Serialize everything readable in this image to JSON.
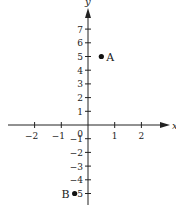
{
  "chart_data": {
    "type": "scatter",
    "title": "",
    "xlabel": "x",
    "ylabel": "y",
    "xlim": [
      -3.1,
      3.0
    ],
    "ylim": [
      -5.8,
      8.5
    ],
    "grid": false,
    "x_ticks": [
      -2,
      -1,
      1,
      2
    ],
    "x_tick_labels": [
      "−2",
      "−1",
      "1",
      "2"
    ],
    "y_ticks": [
      7,
      6,
      5,
      4,
      3,
      2,
      1,
      -1,
      -2,
      -3,
      -4,
      -5
    ],
    "y_tick_labels": [
      "7",
      "6",
      "5",
      "4",
      "3",
      "2",
      "1",
      "−1",
      "−2",
      "−3",
      "−4",
      "5"
    ],
    "origin_label": "0",
    "points": [
      {
        "label": "A",
        "x": 0.5,
        "y": 5
      },
      {
        "label": "B",
        "x": -0.5,
        "y": -5
      }
    ]
  },
  "colors": {
    "axis": "#222222",
    "point": "#111111",
    "background": "#ffffff"
  }
}
